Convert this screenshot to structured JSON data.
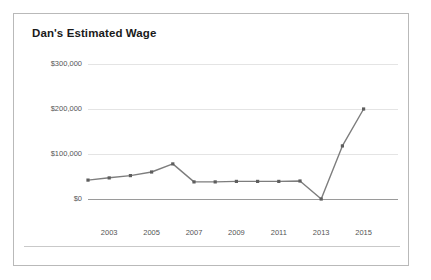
{
  "chart": {
    "title": "Dan's Estimated Wage"
  },
  "chart_data": {
    "type": "line",
    "title": "Dan's Estimated Wage",
    "xlabel": "",
    "ylabel": "",
    "x": [
      2002,
      2003,
      2004,
      2005,
      2006,
      2007,
      2008,
      2009,
      2010,
      2011,
      2012,
      2013,
      2014,
      2015
    ],
    "values": [
      42000,
      47000,
      52000,
      60000,
      78000,
      38000,
      38000,
      39000,
      39000,
      39000,
      40000,
      0,
      118000,
      200000
    ],
    "series": [
      {
        "name": "Dan's Estimated Wage",
        "values": [
          42000,
          47000,
          52000,
          60000,
          78000,
          38000,
          38000,
          39000,
          39000,
          39000,
          40000,
          0,
          118000,
          200000
        ]
      }
    ],
    "xlim": [
      2002,
      2015
    ],
    "ylim": [
      0,
      300000
    ],
    "x_tick_labels": [
      "2003",
      "2005",
      "2007",
      "2009",
      "2011",
      "2013",
      "2015"
    ],
    "x_tick_values": [
      2003,
      2005,
      2007,
      2009,
      2011,
      2013,
      2015
    ],
    "y_tick_labels": [
      "$0",
      "$100,000",
      "$200,000",
      "$300,000"
    ],
    "y_tick_values": [
      0,
      100000,
      200000,
      300000
    ],
    "grid": true,
    "legend": false,
    "markers": "square",
    "line_color": "#7d7d7d",
    "marker_color": "#5e5e5e",
    "grid_color": "#e4e4e4",
    "axis_color": "#9a9a9a"
  }
}
